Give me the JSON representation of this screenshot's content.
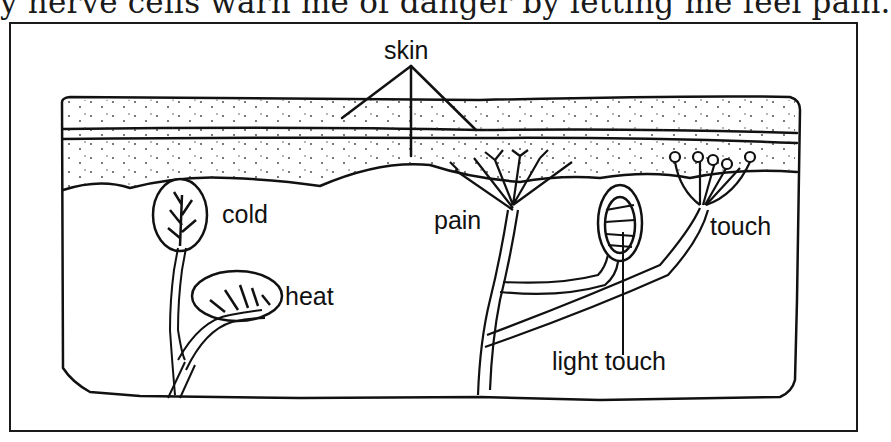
{
  "caption": "y nerve cells warn me of danger by letting me feel pain.",
  "diagram": {
    "labels": {
      "skin": "skin",
      "cold": "cold",
      "heat": "heat",
      "pain": "pain",
      "touch": "touch",
      "light_touch": "light touch"
    },
    "colors": {
      "ink": "#111111",
      "paper": "#ffffff"
    }
  }
}
